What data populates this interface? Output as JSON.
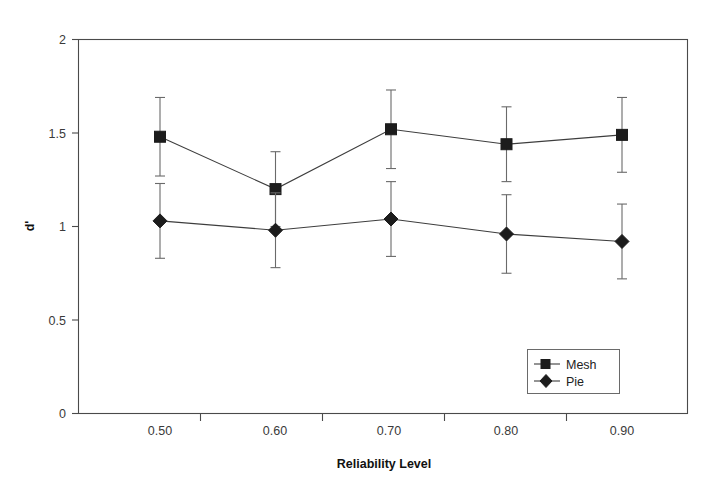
{
  "chart_data": {
    "type": "line",
    "title": "",
    "xlabel": "Reliability Level",
    "ylabel": "d'",
    "categories": [
      "0.50",
      "0.60",
      "0.70",
      "0.80",
      "0.90"
    ],
    "x": [
      0.5,
      0.6,
      0.7,
      0.8,
      0.9
    ],
    "xlim": [
      0.45,
      0.95
    ],
    "ylim": [
      0,
      2
    ],
    "yticks": [
      "0",
      "0.5",
      "1",
      "1.5",
      "2"
    ],
    "ytick_values": [
      0,
      0.5,
      1,
      1.5,
      2
    ],
    "xticks": [
      "0.50",
      "0.60",
      "0.70",
      "0.80",
      "0.90"
    ],
    "grid": false,
    "legend_position": "lower-right",
    "error_bars": "symmetric",
    "series": [
      {
        "name": "Mesh",
        "marker": "square",
        "values": [
          1.48,
          1.2,
          1.52,
          1.44,
          1.49
        ],
        "errors": [
          0.21,
          0.2,
          0.21,
          0.2,
          0.2
        ]
      },
      {
        "name": "Pie",
        "marker": "diamond",
        "values": [
          1.03,
          0.98,
          1.04,
          0.96,
          0.92
        ],
        "errors": [
          0.2,
          0.2,
          0.2,
          0.21,
          0.2
        ]
      }
    ]
  },
  "axes": {
    "y_title": "d'",
    "x_title": "Reliability Level"
  },
  "legend": {
    "entries": [
      {
        "label": "Mesh",
        "marker": "square"
      },
      {
        "label": "Pie",
        "marker": "diamond"
      }
    ]
  },
  "colors": {
    "marker": "#1c1c1c",
    "line": "#3d3d3d",
    "error_bar": "#6a6a6a",
    "frame": "#4a4a4a",
    "background": "#ffffff",
    "text": "#1a1a1a"
  }
}
